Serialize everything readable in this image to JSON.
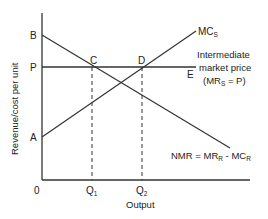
{
  "diagram": {
    "y_axis_label": "Revenue/cost per unit",
    "x_axis_label": "Output",
    "origin_label": "0",
    "points": {
      "B": "B",
      "P": "P",
      "A": "A",
      "C": "C",
      "D": "D",
      "E": "E"
    },
    "x_ticks": {
      "q1": "Q",
      "q1_sub": "1",
      "q2": "Q",
      "q2_sub": "2"
    },
    "curves": {
      "mcs": {
        "main": "MC",
        "sub": "S"
      },
      "price_line": {
        "line1": "Intermediate",
        "line2": "market price",
        "line3_pre": "(MR",
        "line3_sub": "S",
        "line3_post": " = P)"
      },
      "nmr": {
        "pre": "NMR = MR",
        "sub1": "R",
        "mid": " - MC",
        "sub2": "R"
      }
    },
    "colors": {
      "line": "#333333",
      "text": "#222222",
      "background": "#ffffff"
    }
  }
}
